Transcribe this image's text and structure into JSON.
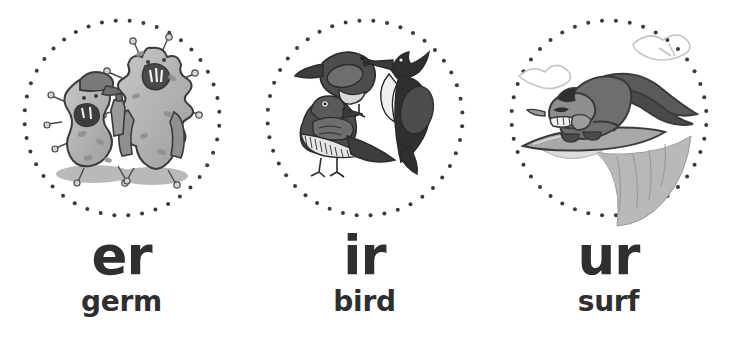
{
  "page": {
    "background_color": "#ffffff",
    "text_color": "#2f2f2f",
    "dot_color": "#3a3a3a",
    "dot_count": 44,
    "dot_radius_px": 2,
    "circle_diameter_px": 195
  },
  "cards": [
    {
      "id": "card-er",
      "phoneme": "er",
      "word": "germ",
      "illustration": {
        "name": "two-cartoon-germ-characters",
        "description": "Two grey cartoon germ characters with spikes; the left one wears a cap and holds a bottle, the right one wears a coat",
        "palette": {
          "outline": "#3a3a3a",
          "body_light": "#c9c9c9",
          "body_mid": "#a6a6a6",
          "body_dark": "#8a8a8a",
          "shadow": "#b5b5b5"
        }
      }
    },
    {
      "id": "card-ir",
      "phoneme": "ir",
      "word": "bird",
      "illustration": {
        "name": "three-birds",
        "description": "Three stylised black-and-grey birds: a small perched songbird, a tall woodpecker and a long-tailed ground bird",
        "palette": {
          "outline": "#2b2b2b",
          "body_dark": "#3d3d3d",
          "body_mid": "#6b6b6b",
          "body_light": "#cfcfcf",
          "belly": "#f2f2f2"
        }
      }
    },
    {
      "id": "card-ur",
      "phoneme": "ur",
      "word": "surf",
      "illustration": {
        "name": "rabbit-surfing-a-wave",
        "description": "Grey cartoon rabbit with long ears riding a surfboard down a breaking wave, with spray clouds above",
        "palette": {
          "outline": "#3a3a3a",
          "body_dark": "#5a5a5a",
          "body_mid": "#8e8e8e",
          "wave": "#b9b9b9",
          "spray": "#dedede"
        }
      }
    }
  ]
}
